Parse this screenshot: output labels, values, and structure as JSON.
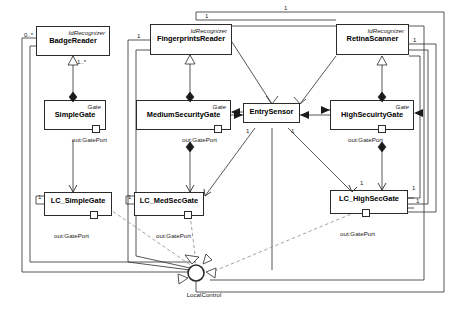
{
  "diagram": {
    "stereotype_recognizer": "IdRecognizer",
    "stereotype_gate": "Gate",
    "port_label": "out:GatePort",
    "local_control_label": "LocalControl",
    "colors": {
      "line": "#2b2b2b",
      "dashed": "#9a9a9a",
      "fill": "#ffffff",
      "text": "#000000"
    }
  },
  "recognizers": [
    {
      "id": "badge",
      "stereotype": "IdRecognizer",
      "name": "BadgeReader"
    },
    {
      "id": "fingerprints",
      "stereotype": "IdRecognizer",
      "name": "FingerprintsReader"
    },
    {
      "id": "retina",
      "stereotype": "IdRecognizer",
      "name": "RetinaScanner"
    }
  ],
  "gates": [
    {
      "id": "simple",
      "stereotype": "Gate",
      "name": "SimpleGate",
      "port": "out:GatePort"
    },
    {
      "id": "medium",
      "stereotype": "Gate",
      "name": "MediumSecurityGate",
      "port": "out:GatePort"
    },
    {
      "id": "high",
      "stereotype": "Gate",
      "name": "HighSecuirtyGate",
      "port": "out:GatePort"
    }
  ],
  "sensor": {
    "id": "entry",
    "name": "EntrySensor"
  },
  "controllers": [
    {
      "id": "lc_simple",
      "name": "LC_SimpleGate",
      "port": "out:GatePort"
    },
    {
      "id": "lc_med",
      "name": "LC_MedSecGate",
      "port": "out:GatePort"
    },
    {
      "id": "lc_high",
      "name": "LC_HighSecGate",
      "port": "out:GatePort"
    }
  ],
  "interface": {
    "id": "localcontrol",
    "name": "LocalControl"
  },
  "multiplicities": [
    {
      "id": "m_badge_assoc",
      "value": "0..*"
    },
    {
      "id": "m_badge_comp",
      "value": "1..*"
    },
    {
      "id": "m_fp_top",
      "value": "1"
    },
    {
      "id": "m_fp_left",
      "value": "1"
    },
    {
      "id": "m_retina_top",
      "value": "1"
    },
    {
      "id": "m_retina_right",
      "value": "1"
    },
    {
      "id": "m_entry_left",
      "value": "1"
    },
    {
      "id": "m_entry_right",
      "value": "1"
    },
    {
      "id": "m_lc_simple",
      "value": "1"
    },
    {
      "id": "m_lc_med",
      "value": "1"
    },
    {
      "id": "m_lc_high_a",
      "value": "1"
    },
    {
      "id": "m_lc_high_b",
      "value": "1"
    },
    {
      "id": "m_lc_high_c",
      "value": "1"
    }
  ]
}
